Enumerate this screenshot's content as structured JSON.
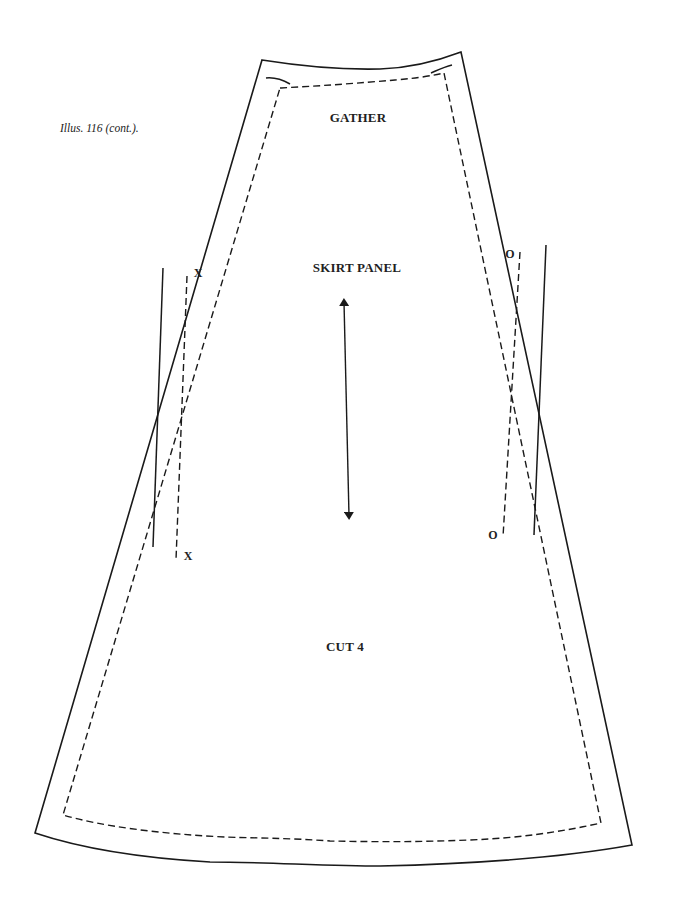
{
  "caption": "Illus. 116 (cont.).",
  "pattern_piece": {
    "name": "SKIRT PANEL",
    "top_instruction": "GATHER",
    "cut_instruction": "CUT 4",
    "grainline": "double-headed-arrow"
  },
  "notch_marks": {
    "left_top": "X",
    "left_bottom": "X",
    "right_top": "O",
    "right_bottom": "O"
  },
  "line_styles": {
    "cutting_line": "solid",
    "seam_line": "dashed",
    "stroke_color": "#1a1a1a"
  }
}
